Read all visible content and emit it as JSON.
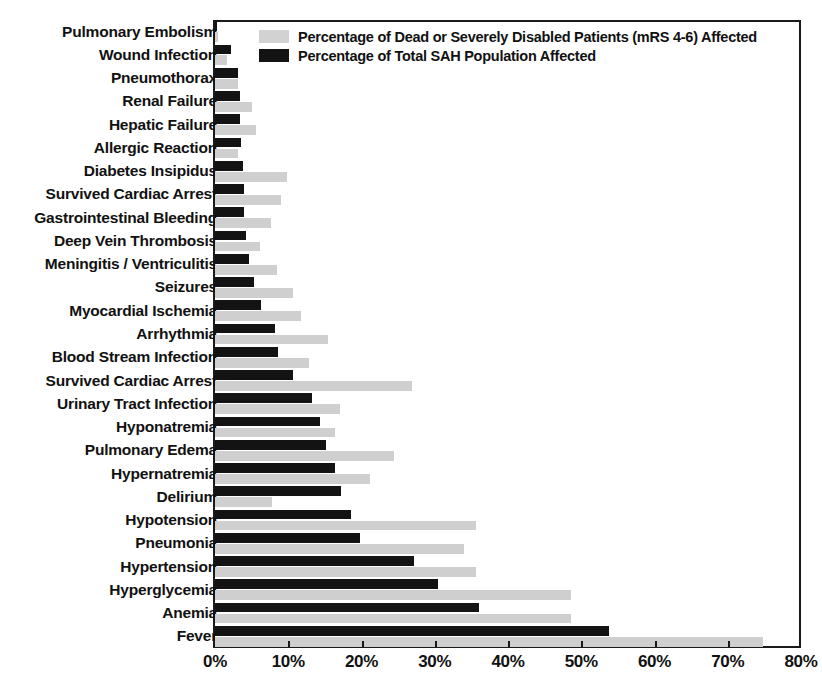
{
  "chart_data": {
    "type": "bar",
    "orientation": "horizontal",
    "title": "",
    "subtitle": "",
    "xlabel": "",
    "ylabel": "",
    "xlim": [
      0,
      80
    ],
    "xtick_labels": [
      "0%",
      "10%",
      "20%",
      "30%",
      "40%",
      "50%",
      "60%",
      "70%",
      "80%"
    ],
    "xticks": [
      0,
      10,
      20,
      30,
      40,
      50,
      60,
      70,
      80
    ],
    "grid": false,
    "legend_position": "top-left-inside",
    "categories": [
      "Pulmonary Embolism",
      "Wound Infection",
      "Pneumothorax",
      "Renal Failure",
      "Hepatic Failure",
      "Allergic Reaction",
      "Diabetes Insipidus",
      "Survived Cardiac Arrest",
      "Gastrointestinal Bleeding",
      "Deep Vein Thrombosis",
      "Meningitis / Ventriculitis",
      "Seizures",
      "Myocardial Ischemia",
      "Arrhythmia",
      "Blood Stream Infection",
      "Survived Cardiac Arrest",
      "Urinary Tract Infection",
      "Hyponatremia",
      "Pulmonary Edema",
      "Hypernatremia",
      "Delirium",
      "Hypotension",
      "Pneumonia",
      "Hypertension",
      "Hyperglycemia",
      "Anemia",
      "Fever"
    ],
    "series": [
      {
        "name": "Percentage of Dead or Severely Disabled Patients (mRS 4-6) Affected",
        "color": "#cfcfcf",
        "values": [
          0.4,
          1.6,
          3.2,
          5.0,
          5.6,
          3.2,
          9.8,
          9.0,
          7.6,
          6.2,
          8.4,
          10.6,
          11.8,
          15.4,
          12.8,
          26.9,
          17.1,
          16.4,
          24.4,
          21.2,
          7.8,
          35.6,
          34.0,
          35.6,
          48.6,
          48.6,
          74.8
        ]
      },
      {
        "name": "Percentage of Total SAH Population Affected",
        "color": "#131313",
        "values": [
          0.3,
          2.2,
          3.1,
          3.4,
          3.4,
          3.6,
          3.8,
          3.9,
          4.0,
          4.2,
          4.7,
          5.3,
          6.3,
          8.2,
          8.6,
          10.6,
          13.2,
          14.4,
          15.2,
          16.4,
          17.2,
          18.6,
          19.8,
          27.2,
          30.4,
          36.0,
          53.8
        ]
      }
    ]
  },
  "legend": {
    "items": [
      {
        "swatch": "gray",
        "label": "Percentage of Dead or Severely Disabled Patients (mRS 4-6) Affected"
      },
      {
        "swatch": "black",
        "label": "Percentage of Total SAH Population Affected"
      }
    ]
  }
}
